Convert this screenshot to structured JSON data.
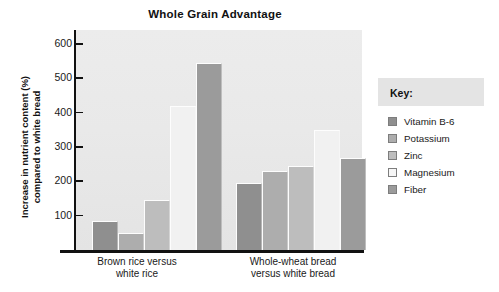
{
  "chart_data": {
    "type": "bar",
    "title": "Whole Grain Advantage",
    "xlabel": "",
    "ylabel": "Increase in nutrient content (%) compared to white bread",
    "ylabel_line1": "Increase in nutrient content (%)",
    "ylabel_line2": "compared to white bread",
    "ylim": [
      0,
      640
    ],
    "yticks": [
      100,
      200,
      300,
      400,
      500,
      600
    ],
    "ytick_labels": [
      "100",
      "200",
      "300",
      "400",
      "500",
      "600"
    ],
    "grid": false,
    "legend_position": "right",
    "categories": [
      "Brown rice versus white rice",
      "Whole-wheat bread versus white bread"
    ],
    "category_lines": [
      [
        "Brown rice versus",
        "white rice"
      ],
      [
        "Whole-wheat bread",
        "versus white bread"
      ]
    ],
    "series": [
      {
        "name": "Vitamin B-6",
        "color": "#8f8f8f",
        "values": [
          85,
          195
        ]
      },
      {
        "name": "Potassium",
        "color": "#adadad",
        "values": [
          50,
          230
        ]
      },
      {
        "name": "Zinc",
        "color": "#bdbdbd",
        "values": [
          145,
          243
        ]
      },
      {
        "name": "Magnesium",
        "color": "#f1f1f1",
        "values": [
          420,
          350
        ]
      },
      {
        "name": "Fiber",
        "color": "#9b9b9b",
        "values": [
          545,
          268
        ]
      }
    ]
  },
  "legend": {
    "title": "Key:",
    "items": [
      {
        "label": "Vitamin B-6",
        "color": "#8f8f8f"
      },
      {
        "label": "Potassium",
        "color": "#adadad"
      },
      {
        "label": "Zinc",
        "color": "#bdbdbd"
      },
      {
        "label": "Magnesium",
        "color": "#f6f6f6"
      },
      {
        "label": "Fiber",
        "color": "#9b9b9b"
      }
    ]
  },
  "colors": {
    "plot_background": "#e9e9e9",
    "axis": "#111111",
    "legend_title_background": "#e4e4e4",
    "page_background": "#ffffff"
  }
}
